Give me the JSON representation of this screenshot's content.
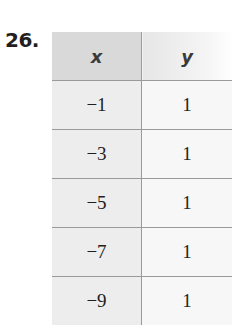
{
  "problem_number": "26.",
  "table": {
    "headers": [
      "x",
      "y"
    ],
    "rows": [
      {
        "x": "−1",
        "y": "1"
      },
      {
        "x": "−3",
        "y": "1"
      },
      {
        "x": "−5",
        "y": "1"
      },
      {
        "x": "−7",
        "y": "1"
      },
      {
        "x": "−9",
        "y": "1"
      }
    ]
  }
}
